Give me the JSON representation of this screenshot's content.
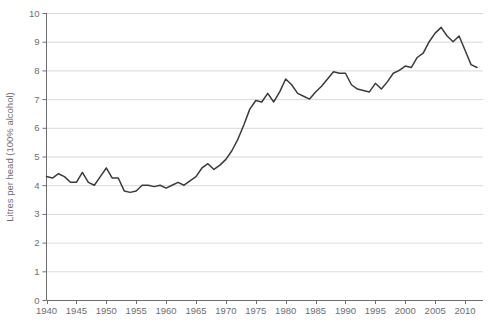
{
  "chart_data": {
    "type": "line",
    "title": "",
    "xlabel": "",
    "ylabel": "Litres per head (100% alcohol)",
    "xlim": [
      1940,
      2013
    ],
    "ylim": [
      0,
      10
    ],
    "grid": true,
    "legend": "none",
    "y_ticks": [
      "0",
      "1",
      "2",
      "3",
      "4",
      "5",
      "6",
      "7",
      "8",
      "9",
      "10"
    ],
    "y_tick_values": [
      0,
      1,
      2,
      3,
      4,
      5,
      6,
      7,
      8,
      9,
      10
    ],
    "x_ticks": [
      "1940",
      "1945",
      "1950",
      "1955",
      "1960",
      "1965",
      "1970",
      "1975",
      "1980",
      "1985",
      "1990",
      "1995",
      "2000",
      "2005",
      "2010"
    ],
    "x_tick_values": [
      1940,
      1945,
      1950,
      1955,
      1960,
      1965,
      1970,
      1975,
      1980,
      1985,
      1990,
      1995,
      2000,
      2005,
      2010
    ],
    "series": [
      {
        "name": "Litres per head (100% alcohol)",
        "color": "#3b3b3b",
        "x": [
          1940,
          1941,
          1942,
          1943,
          1944,
          1945,
          1946,
          1947,
          1948,
          1949,
          1950,
          1951,
          1952,
          1953,
          1954,
          1955,
          1956,
          1957,
          1958,
          1959,
          1960,
          1961,
          1962,
          1963,
          1964,
          1965,
          1966,
          1967,
          1968,
          1969,
          1970,
          1971,
          1972,
          1973,
          1974,
          1975,
          1976,
          1977,
          1978,
          1979,
          1980,
          1981,
          1982,
          1983,
          1984,
          1985,
          1986,
          1987,
          1988,
          1989,
          1990,
          1991,
          1992,
          1993,
          1994,
          1995,
          1996,
          1997,
          1998,
          1999,
          2000,
          2001,
          2002,
          2003,
          2004,
          2005,
          2006,
          2007,
          2008,
          2009,
          2010,
          2011,
          2012
        ],
        "y": [
          4.3,
          4.25,
          4.4,
          4.3,
          4.1,
          4.1,
          4.45,
          4.1,
          4.0,
          4.3,
          4.6,
          4.25,
          4.25,
          3.8,
          3.75,
          3.8,
          4.0,
          4.0,
          3.95,
          4.0,
          3.9,
          4.0,
          4.1,
          4.0,
          4.15,
          4.3,
          4.6,
          4.75,
          4.55,
          4.7,
          4.9,
          5.2,
          5.6,
          6.1,
          6.65,
          6.95,
          6.9,
          7.2,
          6.9,
          7.25,
          7.7,
          7.5,
          7.2,
          7.1,
          7.0,
          7.25,
          7.45,
          7.7,
          7.95,
          7.9,
          7.9,
          7.5,
          7.35,
          7.3,
          7.25,
          7.55,
          7.35,
          7.6,
          7.9,
          8.0,
          8.15,
          8.1,
          8.45,
          8.6,
          9.0,
          9.3,
          9.5,
          9.2,
          9.0,
          9.2,
          8.7,
          8.2,
          8.1
        ]
      }
    ]
  },
  "axis": {
    "y_axis_title": "Litres per head (100% alcohol)"
  }
}
